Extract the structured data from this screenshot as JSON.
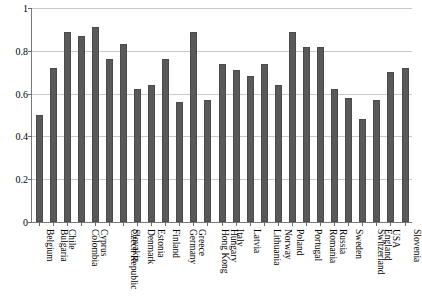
{
  "chart_data": {
    "type": "bar",
    "title": "",
    "subtitle": "",
    "xlabel": "",
    "ylabel": "",
    "ylim": [
      0,
      1
    ],
    "grid": true,
    "legend": null,
    "bar_color": "#595959",
    "categories": [
      "Belgium",
      "Bulgaria",
      "Chile",
      "Colombia",
      "Cyprus",
      "Czech Republic",
      "Slovakia",
      "Denmark",
      "Estonia",
      "Finland",
      "Germany",
      "Greece",
      "Hong Kong",
      "Hungary",
      "Italy",
      "Latvia",
      "Lithuania",
      "Norway",
      "Poland",
      "Portugal",
      "Romania",
      "Russia",
      "Sweden",
      "Switzerland",
      "England",
      "USA",
      "Slovenia"
    ],
    "values": [
      0.5,
      0.72,
      0.89,
      0.87,
      0.91,
      0.76,
      0.83,
      0.62,
      0.64,
      0.76,
      0.56,
      0.89,
      0.57,
      0.74,
      0.71,
      0.68,
      0.74,
      0.64,
      0.89,
      0.82,
      0.82,
      0.62,
      0.58,
      0.48,
      0.57,
      0.7,
      0.72
    ],
    "yticks": [
      0,
      0.2,
      0.4,
      0.6,
      0.8,
      1
    ],
    "ytick_labels": [
      "0",
      "0.2",
      "0.4",
      "0.6",
      "0.8",
      "1"
    ]
  }
}
